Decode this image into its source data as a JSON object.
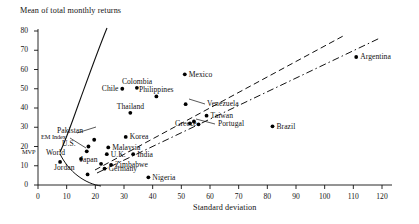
{
  "chart_data": {
    "type": "scatter",
    "title": "",
    "ylabel": "Mean of total monthly returns",
    "xlabel": "Standard deviation",
    "xlim": [
      0,
      120
    ],
    "ylim": [
      0,
      80
    ],
    "xticks": [
      0,
      10,
      20,
      30,
      40,
      50,
      60,
      70,
      80,
      90,
      100,
      110,
      120
    ],
    "yticks": [
      0,
      10,
      20,
      30,
      40,
      50,
      60,
      70,
      80
    ],
    "grid": false,
    "legend": "none",
    "points": [
      {
        "label": "MVP",
        "x": 7.7,
        "y": 12.0,
        "label_pos": "left",
        "marker": true
      },
      {
        "label": "World",
        "x": 15.0,
        "y": 13.5,
        "label_pos": "left",
        "marker": true
      },
      {
        "label": "Jordan",
        "x": 17.3,
        "y": 5.5,
        "label_pos": "left",
        "marker": true
      },
      {
        "label": "EM Index",
        "x": 17.6,
        "y": 20.0,
        "label_pos": "leader",
        "marker": true
      },
      {
        "label": "U.S.",
        "x": 17.0,
        "y": 17.5,
        "label_pos": "left",
        "marker": true
      },
      {
        "label": "Japan",
        "x": 22.0,
        "y": 11.0,
        "label_pos": "left",
        "marker": true
      },
      {
        "label": "Pakistan",
        "x": 19.6,
        "y": 23.5,
        "label_pos": "leader",
        "marker": true
      },
      {
        "label": "Germany",
        "x": 23.2,
        "y": 8.5,
        "label_pos": "right",
        "marker": true
      },
      {
        "label": "U.K.",
        "x": 24.0,
        "y": 16.0,
        "label_pos": "right",
        "marker": true
      },
      {
        "label": "Malaysia",
        "x": 24.5,
        "y": 19.5,
        "label_pos": "right",
        "marker": true
      },
      {
        "label": "Zimbabwe",
        "x": 25.5,
        "y": 10.5,
        "label_pos": "right",
        "marker": true
      },
      {
        "label": "Korea",
        "x": 30.6,
        "y": 25.0,
        "label_pos": "right",
        "marker": true
      },
      {
        "label": "India",
        "x": 33.2,
        "y": 16.0,
        "label_pos": "right",
        "marker": true
      },
      {
        "label": "Thailand",
        "x": 32.2,
        "y": 37.5,
        "label_pos": "above",
        "marker": true
      },
      {
        "label": "Nigeria",
        "x": 38.5,
        "y": 4.0,
        "label_pos": "right",
        "marker": true
      },
      {
        "label": "Chile",
        "x": 29.4,
        "y": 50.0,
        "label_pos": "left",
        "marker": true
      },
      {
        "label": "Colombia",
        "x": 34.5,
        "y": 50.5,
        "label_pos": "above",
        "marker": true
      },
      {
        "label": "Philippines",
        "x": 41.3,
        "y": 46.0,
        "label_pos": "above",
        "marker": true
      },
      {
        "label": "Greece",
        "x": 53.0,
        "y": 32.0,
        "label_pos": "below",
        "marker": true
      },
      {
        "label": "Greece2",
        "x": 54.4,
        "y": 33.0,
        "label_pos": "none",
        "marker": true
      },
      {
        "label": "Venezuela",
        "x": 51.5,
        "y": 42.0,
        "label_pos": "leader",
        "marker": true
      },
      {
        "label": "Mexico",
        "x": 51.2,
        "y": 57.5,
        "label_pos": "right",
        "marker": true
      },
      {
        "label": "Taiwan",
        "x": 58.8,
        "y": 36.0,
        "label_pos": "right",
        "marker": true
      },
      {
        "label": "Portugal",
        "x": 56.0,
        "y": 31.5,
        "label_pos": "leader",
        "marker": true
      },
      {
        "label": "Brazil",
        "x": 81.8,
        "y": 30.5,
        "label_pos": "right",
        "marker": true
      },
      {
        "label": "Argentina",
        "x": 111.0,
        "y": 66.5,
        "label_pos": "right",
        "marker": true
      }
    ],
    "curves": [
      {
        "name": "efficient-frontier",
        "style": "solid"
      },
      {
        "name": "upper-dashed-line",
        "style": "dashed"
      },
      {
        "name": "lower-dash-dot-line",
        "style": "dash-dot"
      },
      {
        "name": "lower-frontier-branch",
        "style": "solid"
      }
    ],
    "annotations": []
  },
  "axis": {
    "y_title": "Mean of total monthly returns",
    "x_title": "Standard deviation",
    "yticks": [
      "80",
      "70",
      "60",
      "50",
      "40",
      "30",
      "20",
      "10",
      "0"
    ],
    "xticks": [
      "0",
      "10",
      "20",
      "30",
      "40",
      "50",
      "60",
      "70",
      "80",
      "90",
      "100",
      "110",
      "120"
    ]
  },
  "colors": {
    "ink": "#111111",
    "background": "#ffffff",
    "marker": "#000000"
  }
}
